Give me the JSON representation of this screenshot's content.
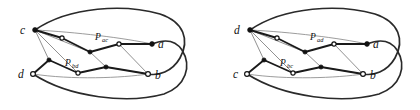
{
  "figure": {
    "type": "graph-drawing-pair",
    "background_color": "#ffffff",
    "ink_color": "#111111",
    "thin_edge_color": "#8a8a8a"
  },
  "diagrams": [
    {
      "id": "left",
      "name": "left-graph",
      "vertex_labels": {
        "a": "a",
        "b": "b",
        "c": "c",
        "d": "d"
      },
      "path_labels": {
        "upper": "P",
        "upper_sub": "ac",
        "lower": "P",
        "lower_sub": "bd"
      }
    },
    {
      "id": "right",
      "name": "right-graph",
      "vertex_labels": {
        "a": "a",
        "b": "b",
        "c": "c",
        "d": "d"
      },
      "path_labels": {
        "upper": "P",
        "upper_sub": "ad",
        "lower": "P",
        "lower_sub": "bc"
      }
    }
  ]
}
